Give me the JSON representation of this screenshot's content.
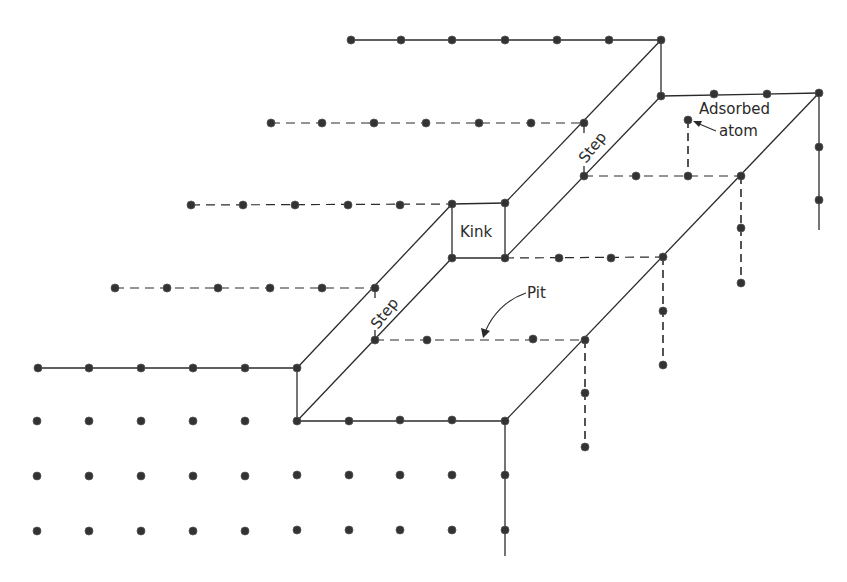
{
  "diagram": {
    "labels": {
      "kink": "Kink",
      "step_upper": "Step",
      "step_lower": "Step",
      "pit": "Pit",
      "adsorbed_line1": "Adsorbed",
      "adsorbed_line2": "atom"
    },
    "colors": {
      "ink": "#2a2a2a",
      "atom": "#333333",
      "background": "#ffffff"
    },
    "atom_rows": {
      "top_row_y40": [
        351,
        401,
        452,
        505,
        557,
        609,
        661
      ],
      "upper_terrace_right_y95": [
        661,
        714,
        767,
        819
      ],
      "right_edge_vertical_x819": [
        93,
        147,
        200
      ],
      "row_y123": [
        271,
        322,
        374,
        426,
        479,
        531,
        584
      ],
      "row_y176": [
        584,
        636,
        688,
        741
      ],
      "adsorbed_atom": [
        688,
        120
      ],
      "row_y205": [
        191,
        243,
        295,
        348,
        400,
        452,
        505
      ],
      "row_y258": [
        452,
        505,
        559,
        611,
        663
      ],
      "row_y288": [
        115,
        167,
        218,
        270,
        322,
        375
      ],
      "pit_row_y340": [
        375,
        427,
        533,
        585
      ],
      "row_y368": [
        38,
        89,
        141,
        193,
        245,
        297
      ],
      "row_y421": [
        37,
        89,
        141,
        193,
        245,
        297,
        349,
        400,
        452,
        505
      ],
      "row_y474": [
        37,
        89,
        141,
        193,
        245,
        297,
        349,
        400,
        452,
        505
      ],
      "row_y527": [
        37,
        89,
        141,
        193,
        245,
        297,
        349,
        400,
        452,
        505
      ],
      "dashed_vertical_x585": [
        340,
        393,
        447
      ],
      "dashed_vertical_x663": [
        257,
        311,
        365
      ],
      "dashed_vertical_x741": [
        176,
        228,
        283
      ]
    }
  }
}
